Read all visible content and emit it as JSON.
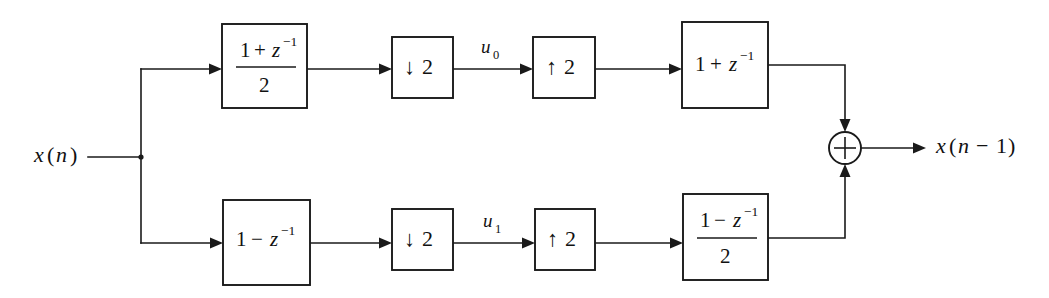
{
  "diagram": {
    "type": "block-diagram",
    "background_color": "#ffffff",
    "line_color": "#1a1a1a",
    "input": {
      "label_x": "x",
      "label_paren_open": "(",
      "label_var": "n",
      "label_paren_close": ")",
      "full_text": "x(n)"
    },
    "output": {
      "label_x": "x",
      "label_paren_open": "(",
      "label_var": "n",
      "label_minus": "−",
      "label_delay": "1",
      "label_paren_close": ")",
      "full_text": "x(n − 1)"
    },
    "summing_junction": {
      "name": "adder",
      "symbol": "+",
      "operation": "sum"
    },
    "branches": [
      {
        "id": "top",
        "name": "lowpass-branch",
        "analysis_filter": {
          "type": "fraction",
          "numerator_lead": "1",
          "numerator_op": "+",
          "numerator_var": "z",
          "numerator_exp": "−1",
          "denominator": "2",
          "full_text": "(1 + z^-1)/2"
        },
        "downsampler": {
          "arrow": "↓",
          "factor": "2",
          "full_text": "↓2"
        },
        "subband_signal": {
          "base": "u",
          "subscript": "0",
          "full_text": "u0"
        },
        "upsampler": {
          "arrow": "↑",
          "factor": "2",
          "full_text": "↑2"
        },
        "synthesis_filter": {
          "type": "plain",
          "lead": "1",
          "op": "+",
          "var": "z",
          "exp": "−1",
          "full_text": "1 + z^-1"
        }
      },
      {
        "id": "bottom",
        "name": "highpass-branch",
        "analysis_filter": {
          "type": "plain",
          "lead": "1",
          "op": "−",
          "var": "z",
          "exp": "−1",
          "full_text": "1 − z^-1"
        },
        "downsampler": {
          "arrow": "↓",
          "factor": "2",
          "full_text": "↓2"
        },
        "subband_signal": {
          "base": "u",
          "subscript": "1",
          "full_text": "u1"
        },
        "upsampler": {
          "arrow": "↑",
          "factor": "2",
          "full_text": "↑2"
        },
        "synthesis_filter": {
          "type": "fraction",
          "numerator_lead": "1",
          "numerator_op": "−",
          "numerator_var": "z",
          "numerator_exp": "−1",
          "denominator": "2",
          "full_text": "(1 − z^-1)/2"
        }
      }
    ]
  }
}
